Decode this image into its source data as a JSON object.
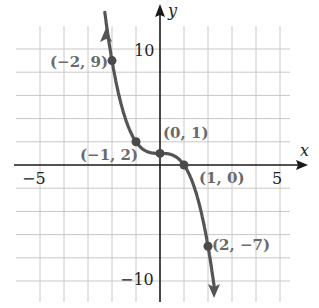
{
  "chart_data": {
    "type": "line",
    "title": "",
    "xlabel": "x",
    "ylabel": "y",
    "xlim": [
      -5.5,
      6
    ],
    "ylim": [
      -11,
      12
    ],
    "grid": true,
    "grid_x_step": 1,
    "grid_y_step": 2,
    "tick_labels": {
      "x": [
        {
          "value": -5,
          "label": "−5"
        },
        {
          "value": 5,
          "label": "5"
        }
      ],
      "y": [
        {
          "value": 10,
          "label": "10"
        },
        {
          "value": -10,
          "label": "−10"
        }
      ]
    },
    "series": [
      {
        "name": "curve",
        "color": "#555555",
        "arrows": "both ends",
        "points": [
          {
            "x": -2,
            "y": 9,
            "label": "(−2, 9)"
          },
          {
            "x": -1,
            "y": 2,
            "label": "(−1, 2)"
          },
          {
            "x": 0,
            "y": 1,
            "label": "(0, 1)"
          },
          {
            "x": 1,
            "y": 0,
            "label": "(1, 0)"
          },
          {
            "x": 2,
            "y": -7,
            "label": "(2, −7)"
          }
        ]
      }
    ]
  }
}
